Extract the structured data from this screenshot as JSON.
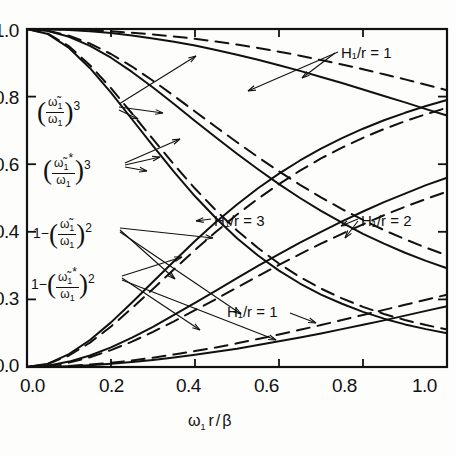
{
  "figure": {
    "background": "#fdfdfb",
    "ink": "#111111"
  },
  "axes": {
    "x": {
      "label_parts": {
        "omega": "ω",
        "sub": "1",
        "r": "r",
        "slash": "/",
        "beta": "β"
      },
      "label_text": "ω₁ r / β",
      "ticks": [
        "0.0",
        "0.2",
        "0.4",
        "0.6",
        "0.8",
        "1.0"
      ],
      "tick_values": [
        0.0,
        0.2,
        0.4,
        0.6,
        0.8,
        1.0
      ],
      "range": [
        0.0,
        1.0
      ]
    },
    "y": {
      "label_text": "",
      "ticks": [
        "1.0",
        "0.8",
        "0.6",
        "0.4",
        "0.3",
        "0.0"
      ],
      "tick_values": [
        1.0,
        0.8,
        0.6,
        0.4,
        0.2,
        0.0
      ],
      "range": [
        0.0,
        1.0
      ]
    }
  },
  "curve_labels": {
    "ratio_cubed": {
      "open": "(",
      "num_omega": "ω̃",
      "num_sub": "1",
      "den_omega": "ω",
      "den_sub": "1",
      "close": ")",
      "exp": "3"
    },
    "ratio_star_cubed": {
      "open": "(",
      "num_omega": "ω̃",
      "num_sub": "1",
      "num_star": "*",
      "den_omega": "ω",
      "den_sub": "1",
      "close": ")",
      "exp": "3"
    },
    "one_minus_sq": {
      "lead": "1−",
      "open": "(",
      "num_omega": "ω̃",
      "num_sub": "1",
      "den_omega": "ω",
      "den_sub": "1",
      "close": ")",
      "exp": "2"
    },
    "one_minus_star_sq": {
      "lead": "1−",
      "open": "(",
      "num_omega": "ω̃",
      "num_sub": "1",
      "num_star": "*",
      "den_omega": "ω",
      "den_sub": "1",
      "close": ")",
      "exp": "2"
    }
  },
  "annotations": {
    "h1": "H₁/r = 1",
    "h3": "H₁/r = 3",
    "h2": "H₁/r = 2",
    "h1b": "H₁/r = 1"
  },
  "chart_data": {
    "type": "line",
    "title": "",
    "xlabel": "ω₁ r / β",
    "ylabel": "",
    "xlim": [
      0.0,
      1.0
    ],
    "ylim": [
      0.0,
      1.0
    ],
    "grid": false,
    "legend_position": "inline-annotations",
    "x": [
      0.0,
      0.05,
      0.1,
      0.15,
      0.2,
      0.25,
      0.3,
      0.35,
      0.4,
      0.45,
      0.5,
      0.55,
      0.6,
      0.65,
      0.7,
      0.75,
      0.8,
      0.85,
      0.9,
      0.95,
      1.0
    ],
    "series": [
      {
        "name": "(ω̃₁/ω₁)³, H₁/r = 1",
        "style": "solid",
        "annotation": "H₁/r = 1",
        "values": [
          1.0,
          0.999,
          0.997,
          0.993,
          0.988,
          0.981,
          0.972,
          0.962,
          0.951,
          0.938,
          0.924,
          0.909,
          0.893,
          0.876,
          0.858,
          0.84,
          0.821,
          0.802,
          0.783,
          0.763,
          0.744
        ]
      },
      {
        "name": "(ω̃₁*/ω₁)³, H₁/r = 1",
        "style": "dashed",
        "annotation": "H₁/r = 1",
        "values": [
          1.0,
          0.9995,
          0.998,
          0.996,
          0.993,
          0.989,
          0.984,
          0.978,
          0.971,
          0.963,
          0.954,
          0.944,
          0.933,
          0.921,
          0.908,
          0.895,
          0.881,
          0.866,
          0.851,
          0.835,
          0.819
        ]
      },
      {
        "name": "(ω̃₁/ω₁)³, H₁/r = 2",
        "style": "solid",
        "annotation": "H₁/r = 2",
        "values": [
          1.0,
          0.994,
          0.977,
          0.95,
          0.915,
          0.873,
          0.827,
          0.778,
          0.728,
          0.679,
          0.631,
          0.585,
          0.541,
          0.5,
          0.462,
          0.427,
          0.394,
          0.365,
          0.338,
          0.314,
          0.292
        ]
      },
      {
        "name": "(ω̃₁*/ω₁)³, H₁/r = 2",
        "style": "dashed",
        "annotation": "H₁/r = 2",
        "values": [
          1.0,
          0.995,
          0.98,
          0.957,
          0.926,
          0.889,
          0.847,
          0.802,
          0.756,
          0.71,
          0.665,
          0.621,
          0.579,
          0.539,
          0.502,
          0.467,
          0.435,
          0.405,
          0.378,
          0.353,
          0.33
        ]
      },
      {
        "name": "(ω̃₁/ω₁)³, H₁/r = 3",
        "style": "solid",
        "annotation": "H₁/r = 3",
        "values": [
          1.0,
          0.985,
          0.944,
          0.884,
          0.812,
          0.733,
          0.654,
          0.577,
          0.505,
          0.44,
          0.381,
          0.33,
          0.285,
          0.247,
          0.214,
          0.187,
          0.163,
          0.143,
          0.126,
          0.112,
          0.1
        ]
      },
      {
        "name": "(ω̃₁*/ω₁)³, H₁/r = 3",
        "style": "dashed",
        "annotation": "H₁/r = 3",
        "values": [
          1.0,
          0.986,
          0.949,
          0.893,
          0.825,
          0.75,
          0.674,
          0.599,
          0.528,
          0.463,
          0.404,
          0.352,
          0.306,
          0.266,
          0.232,
          0.203,
          0.178,
          0.157,
          0.139,
          0.124,
          0.111
        ]
      },
      {
        "name": "1−(ω̃₁/ω₁)², H₁/r = 3",
        "style": "solid",
        "annotation": "H₁/r = 3",
        "values": [
          0.0,
          0.01,
          0.038,
          0.08,
          0.132,
          0.191,
          0.252,
          0.313,
          0.373,
          0.429,
          0.481,
          0.529,
          0.572,
          0.611,
          0.646,
          0.677,
          0.705,
          0.73,
          0.752,
          0.772,
          0.79
        ]
      },
      {
        "name": "1−(ω̃₁*/ω₁)², H₁/r = 3",
        "style": "dashed",
        "annotation": "H₁/r = 3",
        "values": [
          0.0,
          0.009,
          0.034,
          0.072,
          0.12,
          0.174,
          0.231,
          0.289,
          0.346,
          0.4,
          0.451,
          0.498,
          0.541,
          0.581,
          0.617,
          0.649,
          0.678,
          0.704,
          0.727,
          0.748,
          0.767
        ]
      },
      {
        "name": "1−(ω̃₁/ω₁)², H₁/r = 2",
        "style": "solid",
        "annotation": "H₁/r = 2",
        "values": [
          0.0,
          0.004,
          0.016,
          0.034,
          0.058,
          0.087,
          0.119,
          0.154,
          0.19,
          0.226,
          0.263,
          0.299,
          0.334,
          0.368,
          0.4,
          0.431,
          0.46,
          0.488,
          0.513,
          0.538,
          0.56
        ]
      },
      {
        "name": "1−(ω̃₁*/ω₁)², H₁/r = 2",
        "style": "dashed",
        "annotation": "H₁/r = 2",
        "values": [
          0.0,
          0.003,
          0.013,
          0.029,
          0.05,
          0.075,
          0.104,
          0.135,
          0.168,
          0.201,
          0.235,
          0.269,
          0.302,
          0.334,
          0.365,
          0.394,
          0.422,
          0.449,
          0.474,
          0.497,
          0.519
        ]
      },
      {
        "name": "1−(ω̃₁/ω₁)², H₁/r = 1",
        "style": "solid",
        "annotation": "H₁/r = 1",
        "values": [
          0.0,
          0.0006,
          0.0024,
          0.0054,
          0.0095,
          0.0147,
          0.021,
          0.028,
          0.036,
          0.045,
          0.054,
          0.065,
          0.076,
          0.087,
          0.099,
          0.112,
          0.125,
          0.138,
          0.152,
          0.166,
          0.18
        ]
      },
      {
        "name": "1−(ω̃₁*/ω₁)², H₁/r = 1",
        "style": "dashed",
        "annotation": "H₁/r = 1",
        "values": [
          0.0,
          0.0008,
          0.0032,
          0.0071,
          0.0125,
          0.0193,
          0.0275,
          0.037,
          0.047,
          0.058,
          0.07,
          0.083,
          0.096,
          0.11,
          0.124,
          0.139,
          0.154,
          0.169,
          0.184,
          0.199,
          0.214
        ]
      }
    ]
  }
}
